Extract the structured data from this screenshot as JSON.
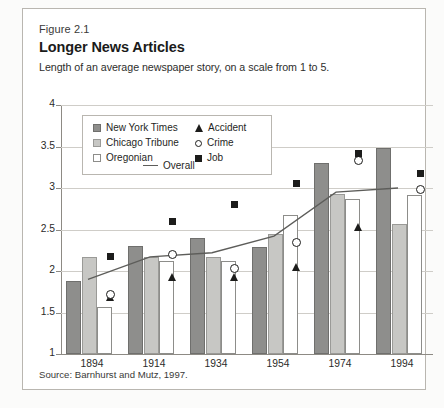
{
  "figure": {
    "number": "Figure 2.1",
    "title": "Longer News Articles",
    "subtitle": "Length of an average newspaper story, on a scale from 1 to 5.",
    "source": "Source: Barnhurst and Mutz, 1997."
  },
  "legend": {
    "entries": [
      {
        "key": "nyt",
        "label": "New York Times",
        "marker": "filled-square-dark-gray"
      },
      {
        "key": "chicago",
        "label": "Chicago Tribune",
        "marker": "filled-square-light-gray"
      },
      {
        "key": "oregonian",
        "label": "Oregonian",
        "marker": "open-square-white"
      },
      {
        "key": "accident",
        "label": "Accident",
        "marker": "filled-triangle"
      },
      {
        "key": "crime",
        "label": "Crime",
        "marker": "open-circle"
      },
      {
        "key": "job",
        "label": "Job",
        "marker": "filled-square"
      },
      {
        "key": "overall",
        "label": "Overall",
        "marker": "line"
      }
    ]
  },
  "colors": {
    "nyt": "#8e8e8c",
    "chicago": "#c7c7c4",
    "oregonian": "#ffffff",
    "marker": "#1c1c1b",
    "overall_line": "#5d5d5a",
    "grid": "#cfcdc8",
    "axis": "#8d8a84"
  },
  "chart_data": {
    "type": "bar",
    "title": "Longer News Articles",
    "subtitle": "Length of an average newspaper story, on a scale from 1 to 5.",
    "xlabel": "",
    "ylabel": "",
    "ylim": [
      1,
      4
    ],
    "yticks": [
      1,
      1.5,
      2,
      2.5,
      3,
      3.5,
      4
    ],
    "ytick_labels": [
      "1",
      "1.5",
      "2",
      "2.5",
      "3",
      "3.5",
      "4"
    ],
    "grid": true,
    "legend_position": "upper-left-inside",
    "categories": [
      "1894",
      "1914",
      "1934",
      "1954",
      "1974",
      "1994"
    ],
    "series": [
      {
        "name": "New York Times",
        "type": "bar",
        "values": [
          1.88,
          2.3,
          2.4,
          2.29,
          3.3,
          3.48
        ]
      },
      {
        "name": "Chicago Tribune",
        "type": "bar",
        "values": [
          2.17,
          2.17,
          2.17,
          2.45,
          2.93,
          2.57
        ]
      },
      {
        "name": "Oregonian",
        "type": "bar",
        "values": [
          1.57,
          2.12,
          2.12,
          2.67,
          2.87,
          2.92
        ]
      },
      {
        "name": "Accident",
        "type": "marker",
        "values": [
          1.64,
          1.88,
          1.88,
          2.0,
          2.48,
          null
        ]
      },
      {
        "name": "Crime",
        "type": "marker",
        "values": [
          1.72,
          2.2,
          2.03,
          2.35,
          3.33,
          2.98
        ]
      },
      {
        "name": "Job",
        "type": "marker",
        "values": [
          2.17,
          2.6,
          2.8,
          3.05,
          3.42,
          3.17
        ]
      },
      {
        "name": "Overall",
        "type": "line",
        "values": [
          1.9,
          2.17,
          2.22,
          2.42,
          2.95,
          3.0
        ]
      }
    ]
  }
}
